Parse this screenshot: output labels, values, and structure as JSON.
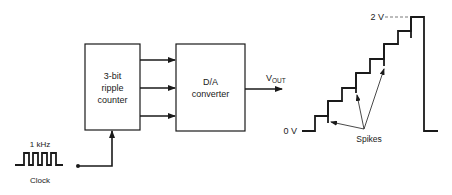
{
  "diagram": {
    "counter": {
      "line1": "3-bit",
      "line2": "ripple",
      "line3": "counter"
    },
    "dac": {
      "line1": "D/A",
      "line2": "converter"
    },
    "output": {
      "label_main": "V",
      "label_sub": "OUT"
    },
    "clock": {
      "frequency": "1 kHz",
      "label": "Clock"
    },
    "waveform": {
      "top_label": "2 V",
      "bottom_label": "0 V",
      "spikes_label": "Spikes",
      "steps": 8
    }
  }
}
